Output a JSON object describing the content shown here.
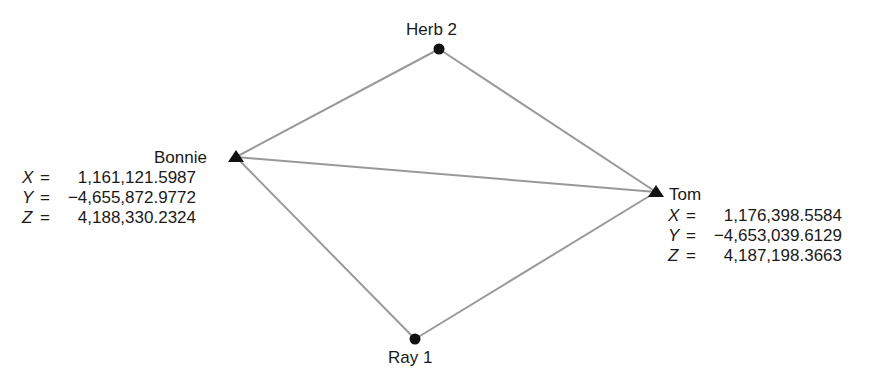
{
  "diagram": {
    "line_color": "#999999",
    "marker_color": "#111111",
    "stations": [
      {
        "name": "Herb 2",
        "marker": "circle"
      },
      {
        "name": "Bonnie",
        "marker": "triangle",
        "coords": {
          "X": "1,161,121.5987",
          "Y": "−4,655,872.9772",
          "Z": "4,188,330.2324"
        }
      },
      {
        "name": "Tom",
        "marker": "triangle",
        "coords": {
          "X": "1,176,398.5584",
          "Y": "−4,653,039.6129",
          "Z": "4,187,198.3663"
        }
      },
      {
        "name": "Ray 1",
        "marker": "circle"
      }
    ],
    "edges": [
      [
        "Herb 2",
        "Bonnie"
      ],
      [
        "Herb 2",
        "Tom"
      ],
      [
        "Bonnie",
        "Tom"
      ],
      [
        "Bonnie",
        "Ray 1"
      ],
      [
        "Tom",
        "Ray 1"
      ]
    ],
    "labels": {
      "x": "X",
      "y": "Y",
      "z": "Z",
      "equals": "="
    }
  }
}
